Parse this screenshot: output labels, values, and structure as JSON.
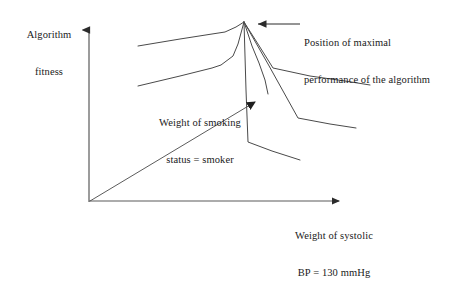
{
  "figure": {
    "kind": "schematic-line-diagram",
    "background_color": "#ffffff",
    "stroke_color": "#3a3a3a",
    "axis_color": "#4a4a4a",
    "axes": {
      "y_axis_label": "Algorithm\nfitness",
      "y_axis_label_line1": "Algorithm",
      "y_axis_label_line2": "fitness",
      "x_axis_label": "Weight of systolic\nBP = 130 mmHg",
      "x_axis_label_line1": "Weight of systolic",
      "x_axis_label_line2": "BP = 130 mmHg",
      "origin": {
        "x": 89,
        "y": 202
      },
      "y_axis_tip": {
        "x": 89,
        "y": 22
      },
      "x_axis_tip": {
        "x": 347,
        "y": 201
      }
    },
    "annotations": [
      {
        "name": "peak-annotation",
        "text": "Position of maximal\nperformance of the algorithm",
        "line1": "Position of maximal",
        "line2": "performance of the algorithm",
        "arrow_from": {
          "x": 300,
          "y": 24
        },
        "arrow_to": {
          "x": 250,
          "y": 24
        }
      },
      {
        "name": "smoking-annotation",
        "text": "Weight of smoking\nstatus = smoker",
        "line1": "Weight of smoking",
        "line2": "status = smoker",
        "arrow_from": {
          "x": 90,
          "y": 201
        },
        "arrow_to": {
          "x": 260,
          "y": 99
        }
      }
    ],
    "peak": {
      "x": 244,
      "y": 22
    },
    "curves": [
      {
        "name": "upper-left-ridge",
        "points": [
          [
            138,
            46
          ],
          [
            225,
            32
          ],
          [
            244,
            22
          ]
        ]
      },
      {
        "name": "lower-left-ridge",
        "points": [
          [
            138,
            86
          ],
          [
            221,
            65
          ],
          [
            236,
            54
          ],
          [
            244,
            22
          ]
        ]
      },
      {
        "name": "right-branch-shallow",
        "points": [
          [
            244,
            22
          ],
          [
            273,
            68
          ],
          [
            370,
            85
          ]
        ]
      },
      {
        "name": "right-branch-mid",
        "points": [
          [
            244,
            22
          ],
          [
            298,
            118
          ],
          [
            356,
            128
          ]
        ]
      },
      {
        "name": "right-branch-steep",
        "points": [
          [
            244,
            22
          ],
          [
            248,
            142
          ],
          [
            300,
            160
          ]
        ]
      },
      {
        "name": "right-branch-inner",
        "points": [
          [
            244,
            22
          ],
          [
            259,
            63
          ],
          [
            268,
            94
          ]
        ]
      }
    ]
  }
}
